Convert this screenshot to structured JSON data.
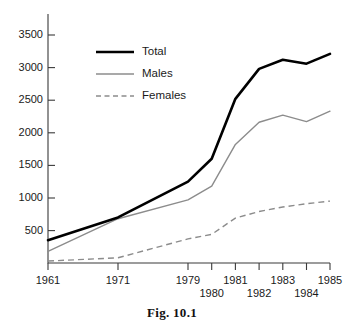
{
  "caption": "Fig. 10.1",
  "chart_data": {
    "type": "line",
    "title": "",
    "xlabel": "",
    "ylabel": "",
    "grid": false,
    "legend_position": "upper-left-inside",
    "categories": [
      "1961",
      "1971",
      "1979",
      "1980",
      "1981",
      "1982",
      "1983",
      "1984",
      "1985"
    ],
    "x_tick_labels": [
      "1961",
      "1971",
      "1979",
      "1980",
      "1981",
      "1982",
      "1983",
      "1984",
      "1985"
    ],
    "y_tick_labels": [
      "500",
      "1000",
      "1500",
      "2000",
      "2500",
      "3000",
      "3500"
    ],
    "y_ticks": [
      500,
      1000,
      1500,
      2000,
      2500,
      3000,
      3500
    ],
    "ylim": [
      0,
      3800
    ],
    "series": [
      {
        "name": "Total",
        "style": "solid-thick-black",
        "color": "#000000",
        "values": [
          350,
          700,
          1250,
          1600,
          2520,
          2980,
          3120,
          3060,
          3210
        ]
      },
      {
        "name": "Males",
        "style": "solid-thin-grey",
        "color": "#8c8c8c",
        "values": [
          180,
          680,
          970,
          1180,
          1820,
          2160,
          2270,
          2170,
          2330
        ]
      },
      {
        "name": "Females",
        "style": "dashed-grey",
        "color": "#8c8c8c",
        "values": [
          30,
          80,
          370,
          440,
          690,
          790,
          860,
          910,
          950
        ]
      }
    ],
    "legend": [
      "Total",
      "Males",
      "Females"
    ]
  },
  "legend": {
    "total_label": "Total",
    "males_label": "Males",
    "females_label": "Females"
  },
  "y_axis": {
    "t3500": "3500",
    "t3000": "3000",
    "t2500": "2500",
    "t2000": "2000",
    "t1500": "1500",
    "t1000": "1000",
    "t500": "500"
  },
  "x_axis": {
    "t1961": "1961",
    "t1971": "1971",
    "t1979": "1979",
    "t1980": "1980",
    "t1981": "1981",
    "t1982": "1982",
    "t1983": "1983",
    "t1984": "1984",
    "t1985": "1985"
  }
}
